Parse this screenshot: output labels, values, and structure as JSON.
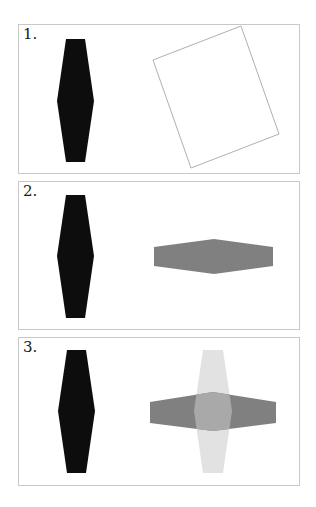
{
  "figure": {
    "colors": {
      "black_shape": "#0d0d0d",
      "rotation_box": "#b0b0b0",
      "gray_shape": "#808080",
      "light_shape": "#e2e2e2",
      "overlap": "#a9a9a9",
      "panel_border": "#c8c8c8"
    },
    "panels": [
      {
        "label": "1.",
        "content": "Black vertical hexagon and an outlined rotated square (rotation frame)"
      },
      {
        "label": "2.",
        "content": "Black vertical hexagon and a gray horizontal hexagon (rotated copy)"
      },
      {
        "label": "3.",
        "content": "Black vertical hexagon and a cross formed by a light vertical hexagon overlapping a gray horizontal hexagon"
      }
    ]
  }
}
